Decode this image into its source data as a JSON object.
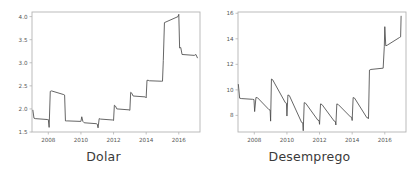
{
  "figure": {
    "background": "#ffffff",
    "width": 413,
    "height": 173,
    "line_color": "#4a4a4a",
    "axis_color": "#b4b4b4",
    "text_color": "#3a3a3a"
  },
  "panels": [
    {
      "key": "dolar",
      "label": "Dolar"
    },
    {
      "key": "desemprego",
      "label": "Desemprego"
    }
  ],
  "chart_data": [
    {
      "type": "line",
      "title": "",
      "xlabel": "Dolar",
      "ylabel": "",
      "grid": false,
      "legend": null,
      "xlim": [
        2007.0,
        2017.3
      ],
      "ylim": [
        1.5,
        4.1
      ],
      "xticks": [
        2008,
        2010,
        2012,
        2014,
        2016
      ],
      "xtick_labels": [
        "2008",
        "2010",
        "2012",
        "2014",
        "2016"
      ],
      "yticks": [
        1.5,
        2.0,
        2.5,
        3.0,
        3.5,
        4.0
      ],
      "ytick_labels": [
        "1.5",
        "2.0",
        "2.5",
        "3.0",
        "3.5",
        "4.0"
      ],
      "series": [
        {
          "name": "Dolar",
          "x": [
            2007.05,
            2007.12,
            2007.2,
            2007.95,
            2008.0,
            2008.05,
            2008.12,
            2008.2,
            2008.95,
            2009.0,
            2009.05,
            2009.12,
            2009.2,
            2009.95,
            2010.0,
            2010.05,
            2010.12,
            2010.2,
            2010.95,
            2011.0,
            2011.05,
            2011.12,
            2011.2,
            2011.95,
            2012.0,
            2012.05,
            2012.12,
            2012.2,
            2012.95,
            2013.0,
            2013.05,
            2013.12,
            2013.2,
            2013.95,
            2014.0,
            2014.05,
            2014.12,
            2014.2,
            2014.95,
            2015.0,
            2015.05,
            2015.12,
            2015.95,
            2016.0,
            2016.05,
            2016.12,
            2016.2,
            2016.95,
            2017.05,
            2017.15
          ],
          "y": [
            1.98,
            1.8,
            1.79,
            1.77,
            1.77,
            1.6,
            2.38,
            2.39,
            2.31,
            2.3,
            1.74,
            1.74,
            1.74,
            1.73,
            1.73,
            1.83,
            1.73,
            1.7,
            1.68,
            1.67,
            1.59,
            1.79,
            1.78,
            1.76,
            1.75,
            2.08,
            2.06,
            2.0,
            1.98,
            1.97,
            2.36,
            2.34,
            2.28,
            2.26,
            2.24,
            2.62,
            2.62,
            2.61,
            2.6,
            2.6,
            3.05,
            3.87,
            4.0,
            4.05,
            3.32,
            3.33,
            3.18,
            3.16,
            3.18,
            3.1
          ]
        }
      ]
    },
    {
      "type": "line",
      "title": "",
      "xlabel": "Desemprego",
      "ylabel": "",
      "grid": false,
      "legend": null,
      "xlim": [
        2007.0,
        2017.3
      ],
      "ylim": [
        6.7,
        16.1
      ],
      "xticks": [
        2008,
        2010,
        2012,
        2014,
        2016
      ],
      "xtick_labels": [
        "2008",
        "2010",
        "2012",
        "2014",
        "2016"
      ],
      "yticks": [
        8,
        10,
        12,
        14,
        16
      ],
      "ytick_labels": [
        "8",
        "10",
        "12",
        "14",
        "16"
      ],
      "series": [
        {
          "name": "Desemprego",
          "x": [
            2007.02,
            2007.1,
            2007.2,
            2007.9,
            2007.98,
            2008.02,
            2008.1,
            2008.2,
            2008.9,
            2008.97,
            2009.0,
            2009.05,
            2009.12,
            2009.9,
            2009.97,
            2010.0,
            2010.06,
            2010.15,
            2010.9,
            2010.97,
            2011.0,
            2011.06,
            2011.15,
            2011.9,
            2011.97,
            2012.0,
            2012.06,
            2012.15,
            2012.9,
            2012.97,
            2013.0,
            2013.06,
            2013.15,
            2013.9,
            2013.97,
            2014.0,
            2014.06,
            2014.15,
            2014.9,
            2014.97,
            2015.0,
            2015.06,
            2015.15,
            2015.9,
            2015.97,
            2016.0,
            2016.06,
            2016.15,
            2016.9,
            2016.97,
            2017.0
          ],
          "y": [
            10.45,
            9.35,
            9.32,
            9.26,
            9.24,
            8.3,
            9.4,
            9.38,
            8.45,
            8.42,
            7.55,
            10.85,
            10.8,
            9.0,
            8.95,
            7.95,
            9.6,
            9.55,
            7.45,
            7.42,
            6.8,
            9.0,
            8.95,
            7.62,
            7.6,
            7.3,
            8.9,
            8.85,
            7.55,
            7.52,
            7.25,
            8.9,
            8.85,
            7.88,
            7.85,
            7.6,
            9.4,
            9.35,
            7.82,
            7.8,
            7.75,
            11.55,
            11.6,
            11.7,
            13.4,
            14.95,
            13.45,
            13.5,
            14.1,
            14.15,
            15.8
          ]
        }
      ]
    }
  ]
}
